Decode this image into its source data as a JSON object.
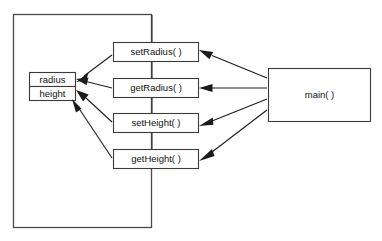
{
  "diagram": {
    "title": "",
    "class_container": {
      "name": "class-boundary",
      "label": ""
    },
    "fields": [
      {
        "label": "radius",
        "name": "field-radius"
      },
      {
        "label": "height",
        "name": "field-height"
      }
    ],
    "methods": [
      {
        "label": "setRadius( )",
        "name": "method-setradius"
      },
      {
        "label": "getRadius( )",
        "name": "method-getradius"
      },
      {
        "label": "setHeight( )",
        "name": "method-setheight"
      },
      {
        "label": "getHeight( )",
        "name": "method-getheight"
      }
    ],
    "caller": {
      "label": "main( )",
      "name": "caller-main"
    },
    "colors": {
      "background": "#ffffff",
      "box_stroke": "#3b3b3b",
      "outer_stroke": "#4a4a4a",
      "arrow": "#1c1c1c",
      "text": "#111111"
    }
  }
}
